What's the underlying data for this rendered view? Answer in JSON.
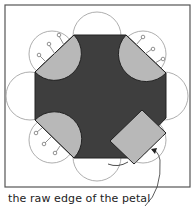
{
  "diagram": {
    "caption": "the raw edge of the petal",
    "colors": {
      "background": "#ffffff",
      "frame": "#555555",
      "octagon": "#3e3e3e",
      "petal_fill": "#b8b8b8",
      "outline": "#888888",
      "pin": "#777777"
    },
    "elements": {
      "octagon": "dark octagon center",
      "petals_folded": [
        "top-left",
        "top-right",
        "bottom-left"
      ],
      "petal_square": "bottom-right square petal with dashed stitch line",
      "circles": 8,
      "pins_per_petal": 3
    }
  }
}
